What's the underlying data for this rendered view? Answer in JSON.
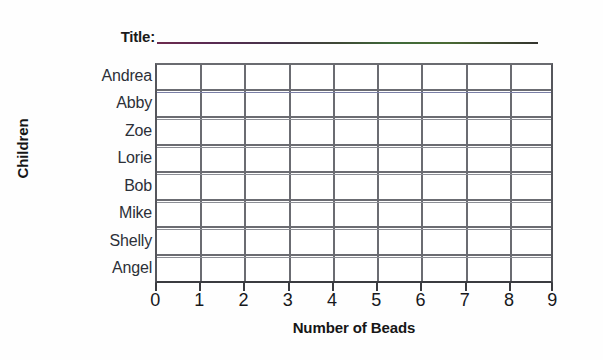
{
  "worksheet": {
    "title_prompt": "Title:",
    "title_value": "",
    "background_color": "#fefefe"
  },
  "chart_data": {
    "type": "bar",
    "orientation": "horizontal",
    "title": "",
    "xlabel": "Number of Beads",
    "ylabel": "Children",
    "categories": [
      "Andrea",
      "Abby",
      "Zoe",
      "Lorie",
      "Bob",
      "Mike",
      "Shelly",
      "Angel"
    ],
    "values": [
      0,
      0,
      0,
      0,
      0,
      0,
      0,
      0
    ],
    "x_tick_labels": [
      "0",
      "1",
      "2",
      "3",
      "4",
      "5",
      "6",
      "7",
      "8",
      "9"
    ],
    "x_ticks": [
      0,
      1,
      2,
      3,
      4,
      5,
      6,
      7,
      8,
      9
    ],
    "xlim": [
      0,
      9
    ],
    "grid": true,
    "legend": false,
    "note": "blank worksheet grid - no bars drawn",
    "grid_line_color": "#6b6c72",
    "axis_color": "#3a3b40",
    "title_rule_gradient": [
      "#6e2a4e",
      "#3f6a3a",
      "#33332e"
    ]
  }
}
